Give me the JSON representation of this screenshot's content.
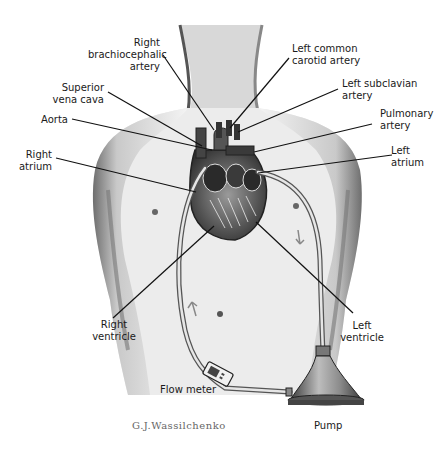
{
  "labels": {
    "right_brachiocephalic_artery": "Right\nbrachiocephalic\nartery",
    "superior_vena_cava": "Superior\nvena cava",
    "aorta": "Aorta",
    "right_atrium": "Right\natrium",
    "left_common_carotid_artery": "Left common\ncarotid artery",
    "left_subclavian_artery": "Left subclavian\nartery",
    "pulmonary_artery": "Pulmonary\nartery",
    "left_atrium": "Left\natrium",
    "right_ventricle": "Right\nventricle",
    "left_ventricle": "Left\nventricle",
    "flow_meter": "Flow meter",
    "pump": "Pump"
  },
  "signature": "G.J.Wassilchenko",
  "colors": {
    "skin_shade": "#9a9a9a",
    "outline": "#222222",
    "background": "#ffffff"
  }
}
